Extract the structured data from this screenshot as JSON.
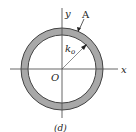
{
  "diagram": {
    "labels": {
      "x_axis": "x",
      "y_axis": "y",
      "area": "A",
      "origin": "O",
      "radius_main": "k",
      "radius_sub": "o",
      "caption": "(d)"
    },
    "shape": {
      "type": "thin ring (annulus)",
      "center": [
        62,
        69
      ],
      "outer_radius": 41,
      "inner_radius": 34,
      "fill_color": "#a8a8a8",
      "stroke_color": "#333333"
    },
    "axes": {
      "horizontal": {
        "from": [
          10,
          69
        ],
        "to": [
          118,
          69
        ]
      },
      "vertical": {
        "from": [
          62,
          8
        ],
        "to": [
          62,
          118
        ]
      }
    }
  }
}
